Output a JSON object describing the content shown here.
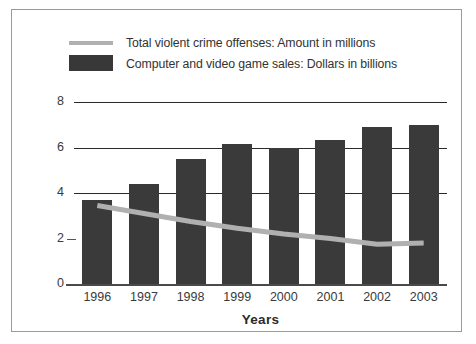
{
  "chart_data": {
    "type": "bar",
    "title": "",
    "xlabel": "Years",
    "ylabel": "",
    "ylim": [
      0,
      8
    ],
    "yticks": [
      0,
      2,
      4,
      6,
      8
    ],
    "grid": true,
    "legend_position": "top",
    "categories": [
      "1996",
      "1997",
      "1998",
      "1999",
      "2000",
      "2001",
      "2002",
      "2003"
    ],
    "series": [
      {
        "name": "Total violent crime offenses: Amount in millions",
        "type": "line",
        "color": "#b0b0b0",
        "values": [
          3.45,
          3.1,
          2.75,
          2.45,
          2.2,
          2.0,
          1.75,
          1.8
        ]
      },
      {
        "name": "Computer and video game sales: Dollars in billions",
        "type": "bar",
        "color": "#3a3a3a",
        "values": [
          3.7,
          4.4,
          5.5,
          6.15,
          6.0,
          6.35,
          6.9,
          7.0
        ]
      }
    ]
  },
  "legend": {
    "items": [
      {
        "label": "Total violent crime offenses: Amount in millions",
        "marker": "line-swatch",
        "color": "#b0b0b0"
      },
      {
        "label": "Computer and video game sales: Dollars in billions",
        "marker": "box-swatch",
        "color": "#383838"
      }
    ]
  },
  "axes": {
    "y_tick_labels": [
      "8",
      "6",
      "4",
      "2",
      "0"
    ],
    "x_tick_labels": [
      "1996",
      "1997",
      "1998",
      "1999",
      "2000",
      "2001",
      "2002",
      "2003"
    ],
    "x_title": "Years"
  },
  "colors": {
    "bar": "#3a3a3a",
    "line": "#b0b0b0",
    "axis": "#2a2a2a",
    "border": "#9a9a9a",
    "background": "#ffffff",
    "text": "#3a3a3a"
  }
}
